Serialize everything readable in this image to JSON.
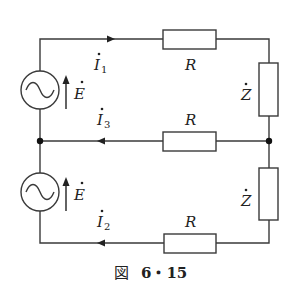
{
  "figure": {
    "caption_prefix": "図",
    "caption_number": "6・15",
    "title": "図 6・15"
  },
  "components": {
    "source_top": {
      "label": "E",
      "dot": "·",
      "type": "ac-voltage-source"
    },
    "source_bottom": {
      "label": "E",
      "dot": "·",
      "type": "ac-voltage-source"
    },
    "resistor_top": {
      "label": "R"
    },
    "resistor_middle": {
      "label": "R"
    },
    "resistor_bottom": {
      "label": "R"
    },
    "impedance_top": {
      "label": "Z",
      "dot": "·"
    },
    "impedance_bottom": {
      "label": "Z",
      "dot": "·"
    }
  },
  "currents": {
    "i1": {
      "label": "I",
      "subscript": "1",
      "direction": "right"
    },
    "i3": {
      "label": "I",
      "subscript": "3",
      "direction": "left"
    },
    "i2": {
      "label": "I",
      "subscript": "2",
      "direction": "left"
    }
  },
  "colors": {
    "line": "#3a3a3a",
    "text": "#222222",
    "background": "#ffffff"
  }
}
